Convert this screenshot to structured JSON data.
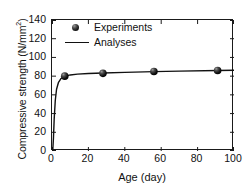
{
  "chart_data": {
    "type": "scatter",
    "title": "",
    "xlabel": "Age (day)",
    "ylabel": "Compressive strength (N/mm",
    "ylabel_sup": "2",
    "ylabel_tail": ")",
    "xlim": [
      0,
      100
    ],
    "ylim": [
      0,
      140
    ],
    "xticks": [
      0,
      20,
      40,
      60,
      80,
      100
    ],
    "yticks": [
      0,
      20,
      40,
      60,
      80,
      100,
      120,
      140
    ],
    "grid": false,
    "legend_position": "upper-left-inside",
    "series": [
      {
        "name": "Experiments",
        "style": "marker",
        "marker": "filled-circle",
        "color": "#111111",
        "x": [
          7,
          28,
          56,
          91
        ],
        "y": [
          80,
          83,
          85,
          86
        ]
      },
      {
        "name": "Analyses",
        "style": "line",
        "color": "#111111",
        "x": [
          0.4,
          0.8,
          1.2,
          1.8,
          2.5,
          3.5,
          5,
          7,
          10,
          14,
          20,
          28,
          40,
          56,
          70,
          91,
          100
        ],
        "y": [
          0,
          14,
          34,
          54,
          66,
          73,
          77.5,
          79.8,
          81.3,
          82.2,
          82.8,
          83.3,
          84.0,
          84.8,
          85.4,
          86.0,
          86.3
        ]
      }
    ]
  },
  "legend": {
    "items": [
      {
        "label": "Experiments",
        "key": "marker"
      },
      {
        "label": "Analyses",
        "key": "line"
      }
    ]
  },
  "axes": {
    "x_tick_labels": [
      "0",
      "20",
      "40",
      "60",
      "80",
      "100"
    ],
    "y_tick_labels": [
      "0",
      "20",
      "40",
      "60",
      "80",
      "100",
      "120",
      "140"
    ]
  }
}
